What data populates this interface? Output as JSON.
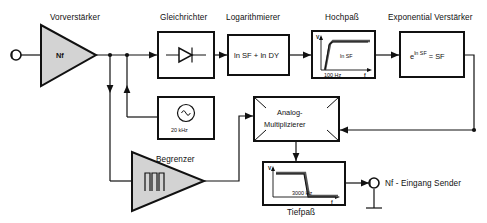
{
  "diagram": {
    "input_terminal": {
      "name": "input-terminal",
      "label": ""
    },
    "blocks": [
      {
        "id": "vorverstaerker",
        "caption": "Vorverstärker",
        "inner": "Nf",
        "shape": "triangle"
      },
      {
        "id": "gleichrichter",
        "caption": "Gleichrichter",
        "inner": "",
        "shape": "box-diode"
      },
      {
        "id": "logarithmierer",
        "caption": "Logarithmierer",
        "inner": "ln SF  +  ln DY",
        "shape": "box"
      },
      {
        "id": "hochpass",
        "caption": "Hochpaß",
        "inner": "ln SF",
        "freq": "100 Hz",
        "axis_y": "V",
        "axis_x": "f",
        "shape": "box-plot"
      },
      {
        "id": "exponential-verstaerker",
        "caption": "Exponential Verstärker",
        "inner": "e",
        "inner_sup": "ln SF",
        "inner_rest": "= SF",
        "shape": "box"
      },
      {
        "id": "oszillator",
        "caption": "",
        "inner": "20 kHz",
        "shape": "box-oscillator"
      },
      {
        "id": "begrenzer",
        "caption": "Begrenzer",
        "inner": "",
        "shape": "triangle-limiter"
      },
      {
        "id": "analog-multiplizierer",
        "caption": "",
        "inner_line1": "Analog-",
        "inner_line2": "Multiplizierer",
        "shape": "box-multiplier"
      },
      {
        "id": "tiefpass",
        "caption": "Tiefpaß",
        "inner": "",
        "freq": "3000 Hz",
        "axis_y": "V",
        "axis_x": "f",
        "shape": "box-plot"
      }
    ],
    "output_terminal": {
      "label": "Nf - Eingang Sender"
    },
    "colors": {
      "line": "#111111",
      "triangle_fill": "#d3d3d3",
      "background": "#ffffff",
      "plot_curve": "#555555"
    }
  }
}
